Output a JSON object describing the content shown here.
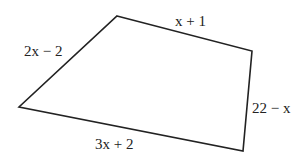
{
  "diagram": {
    "type": "quadrilateral",
    "vertices": [
      [
        117,
        16
      ],
      [
        252,
        51
      ],
      [
        243,
        151
      ],
      [
        19,
        107
      ]
    ],
    "stroke_color": "#222222",
    "side_labels": [
      {
        "text": "2x − 2",
        "side": "left"
      },
      {
        "text": "x + 1",
        "side": "top"
      },
      {
        "text": "22 − x",
        "side": "right"
      },
      {
        "text": "3x + 2",
        "side": "bottom"
      }
    ]
  }
}
